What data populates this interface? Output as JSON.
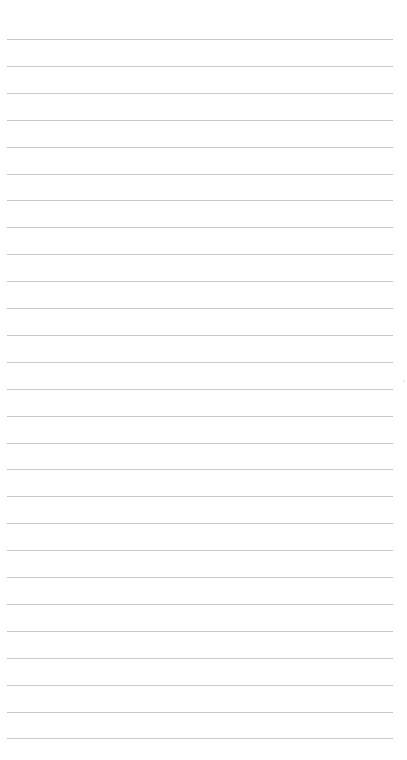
{
  "page": {
    "type": "lined-paper",
    "background_color": "#ffffff",
    "rule_color": "#c9c9c9",
    "rule_count": 27,
    "first_rule_y": 39,
    "rule_spacing": 26.9,
    "rule_left": 7,
    "rule_width": 386
  }
}
